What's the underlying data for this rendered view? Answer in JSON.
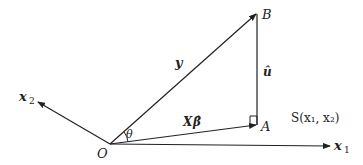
{
  "diagram": {
    "points": {
      "O": {
        "label": "O"
      },
      "A": {
        "label": "A"
      },
      "B": {
        "label": "B"
      }
    },
    "vectors": {
      "y": {
        "label": "y"
      },
      "fitted": {
        "label": "X",
        "hat_label": "β̂"
      },
      "residual": {
        "label": "û"
      },
      "x1": {
        "label": "x",
        "sub": "1"
      },
      "x2": {
        "label": "x",
        "sub": "2"
      }
    },
    "angle": {
      "label": "θ"
    },
    "subspace": {
      "label": "S(x₁, x₂)"
    },
    "colors": {
      "line": "#222222",
      "background": "#ffffff"
    }
  }
}
